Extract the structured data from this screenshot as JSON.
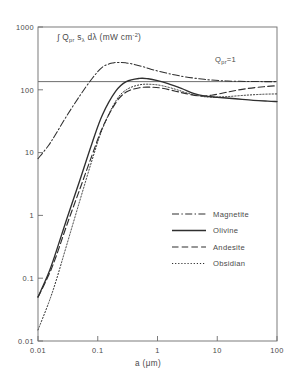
{
  "figure": {
    "y_axis_title": "∫ Q",
    "y_axis_title_sub1": "pr",
    "y_axis_title_mid": " s",
    "y_axis_title_sub2": "λ",
    "y_axis_title_mid2": " dλ  (mW cm",
    "y_axis_title_sup": "-2",
    "y_axis_title_end": ")",
    "x_axis_title": "a (μm)",
    "annotation": "Q",
    "annotation_sub": "pr",
    "annotation_end": "=1"
  },
  "legend": {
    "items": [
      {
        "label": "Magnetite",
        "style": "dash-dot",
        "color": "#2f2f2f"
      },
      {
        "label": "Olivine",
        "style": "solid",
        "color": "#2f2f2f"
      },
      {
        "label": "Andesite",
        "style": "dashed",
        "color": "#2f2f2f"
      },
      {
        "label": "Obsidian",
        "style": "dotted",
        "color": "#2f2f2f"
      }
    ]
  },
  "chart_data": {
    "type": "line",
    "xlabel": "a (μm)",
    "ylabel": "∫ Q_pr s_λ dλ (mW cm^-2)",
    "xscale": "log",
    "yscale": "log",
    "xlim": [
      0.01,
      100
    ],
    "ylim": [
      0.01,
      1000
    ],
    "xticks": [
      0.01,
      0.1,
      1,
      10,
      100
    ],
    "xtick_labels": [
      "0.01",
      "0.1",
      "1",
      "10",
      "100"
    ],
    "yticks": [
      0.01,
      0.1,
      1,
      10,
      100,
      1000
    ],
    "ytick_labels": [
      "0.01",
      "0.1",
      "1",
      "10",
      "100",
      "1000"
    ],
    "grid": false,
    "legend_position": "lower-right-inside",
    "annotations": [
      {
        "text": "Q_pr = 1",
        "type": "horizontal-line",
        "y": 135,
        "label_x": 30,
        "description": "Horizontal reference line marking the asymptotic value where the radiation pressure efficiency Q_pr equals unity."
      }
    ],
    "series": [
      {
        "name": "Magnetite",
        "style": "dash-dot",
        "x": [
          0.01,
          0.015,
          0.02,
          0.03,
          0.05,
          0.08,
          0.12,
          0.18,
          0.25,
          0.3,
          0.4,
          0.6,
          0.9,
          1.4,
          2.0,
          3.0,
          5.0,
          8.0,
          15.0,
          30.0,
          60.0,
          100.0
        ],
        "y": [
          8.0,
          13.0,
          20.0,
          38.0,
          80.0,
          150.0,
          230.0,
          268.0,
          272.0,
          268.0,
          255.0,
          230.0,
          205.0,
          185.0,
          172.0,
          160.0,
          150.0,
          143.0,
          138.0,
          136.0,
          135.0,
          135.0
        ]
      },
      {
        "name": "Olivine",
        "style": "solid",
        "x": [
          0.01,
          0.015,
          0.02,
          0.03,
          0.05,
          0.08,
          0.12,
          0.2,
          0.3,
          0.5,
          0.7,
          1.0,
          1.5,
          2.5,
          4.0,
          6.0,
          10.0,
          20.0,
          40.0,
          70.0,
          100.0
        ],
        "y": [
          0.05,
          0.12,
          0.26,
          0.85,
          3.6,
          14.0,
          40.0,
          95.0,
          135.0,
          152.0,
          150.0,
          140.0,
          125.0,
          105.0,
          88.0,
          80.0,
          76.0,
          72.0,
          68.0,
          66.0,
          65.0
        ]
      },
      {
        "name": "Andesite",
        "style": "dashed",
        "x": [
          0.01,
          0.015,
          0.02,
          0.03,
          0.05,
          0.08,
          0.12,
          0.2,
          0.3,
          0.5,
          0.8,
          1.2,
          2.0,
          3.0,
          5.0,
          8.0,
          15.0,
          30.0,
          60.0,
          100.0
        ],
        "y": [
          0.05,
          0.11,
          0.22,
          0.68,
          2.6,
          9.0,
          25.0,
          62.0,
          92.0,
          108.0,
          110.0,
          106.0,
          95.0,
          87.0,
          80.0,
          82.0,
          92.0,
          104.0,
          112.0,
          116.0
        ]
      },
      {
        "name": "Obsidian",
        "style": "dotted",
        "x": [
          0.01,
          0.015,
          0.02,
          0.03,
          0.05,
          0.08,
          0.12,
          0.2,
          0.3,
          0.5,
          0.8,
          1.2,
          2.0,
          3.0,
          5.0,
          8.0,
          15.0,
          30.0,
          60.0,
          100.0
        ],
        "y": [
          0.015,
          0.04,
          0.09,
          0.33,
          1.7,
          7.5,
          24.0,
          66.0,
          100.0,
          120.0,
          122.0,
          116.0,
          102.0,
          90.0,
          80.0,
          76.0,
          78.0,
          82.0,
          85.0,
          86.0
        ]
      }
    ]
  }
}
